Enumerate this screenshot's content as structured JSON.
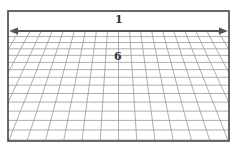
{
  "diagram": {
    "labels": {
      "top": "1",
      "center": "6"
    },
    "frame": {
      "x": 8,
      "y": 11,
      "width": 221,
      "height": 130,
      "stroke": "#444444"
    },
    "arrow": {
      "y": 31,
      "x1": 9,
      "x2": 228,
      "color": "#555555",
      "double_headed": true
    },
    "grid": {
      "top_y": 31,
      "bottom_y": 140,
      "columns": 20,
      "rows": 14,
      "line_color": "#9a9a9a",
      "perspective": "vanishing point above center"
    }
  }
}
